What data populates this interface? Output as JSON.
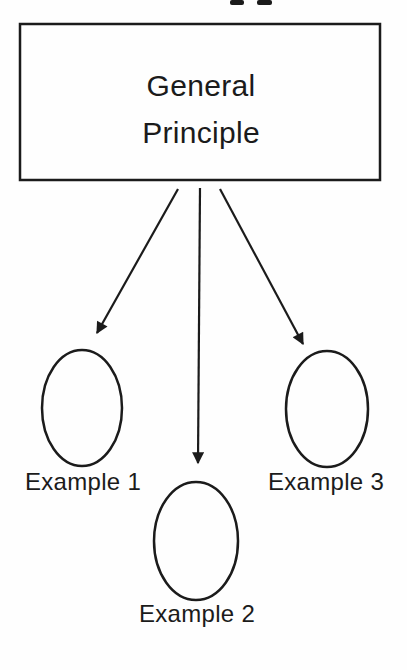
{
  "page": {
    "background_color": "#fefefe",
    "ink_color": "#1b1b1b"
  },
  "icons": {
    "top_edge_fragment": "cropped-letter-descenders"
  },
  "diagram": {
    "principle_box": {
      "line1": "General",
      "line2": "Principle"
    },
    "examples": [
      {
        "label": "Example 1"
      },
      {
        "label": "Example 2"
      },
      {
        "label": "Example 3"
      }
    ]
  }
}
